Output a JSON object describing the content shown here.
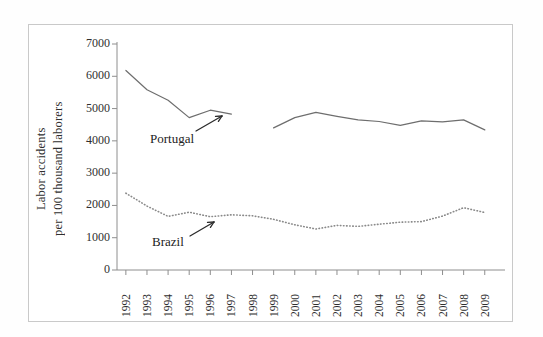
{
  "chart_data": {
    "type": "line",
    "title": "",
    "xlabel": "",
    "ylabel": "Labor accidents per 100 thousand laborers",
    "ylabel_line1": "Labor accidents",
    "ylabel_line2": "per 100 thousand  laborers",
    "categories": [
      "1992",
      "1993",
      "1994",
      "1995",
      "1996",
      "1997",
      "1998",
      "1999",
      "2000",
      "2001",
      "2002",
      "2003",
      "2004",
      "2005",
      "2006",
      "2007",
      "2008",
      "2009"
    ],
    "x": [
      1992,
      1993,
      1994,
      1995,
      1996,
      1997,
      1998,
      1999,
      2000,
      2001,
      2002,
      2003,
      2004,
      2005,
      2006,
      2007,
      2008,
      2009
    ],
    "ylim": [
      0,
      7000
    ],
    "yticks": [
      0,
      1000,
      2000,
      3000,
      4000,
      5000,
      6000,
      7000
    ],
    "ytick_labels": [
      "0",
      "1000",
      "2000",
      "3000",
      "4000",
      "5000",
      "6000",
      "7000"
    ],
    "grid": false,
    "legend_position": "inline-annotations",
    "series": [
      {
        "name": "Portugal",
        "style": "solid",
        "color": "#6e6e6e",
        "values": [
          6180,
          5580,
          5260,
          4720,
          4950,
          4830,
          null,
          4400,
          4720,
          4880,
          4760,
          4650,
          4600,
          4480,
          4620,
          4590,
          4650,
          4340
        ]
      },
      {
        "name": "Brazil",
        "style": "dotted",
        "color": "#8a8a8a",
        "values": [
          2380,
          1980,
          1660,
          1790,
          1650,
          1710,
          1680,
          1570,
          1400,
          1270,
          1380,
          1350,
          1420,
          1480,
          1500,
          1670,
          1930,
          1780
        ]
      }
    ],
    "annotations": [
      {
        "name": "Portugal",
        "label": "Portugal"
      },
      {
        "name": "Brazil",
        "label": "Brazil"
      }
    ]
  }
}
